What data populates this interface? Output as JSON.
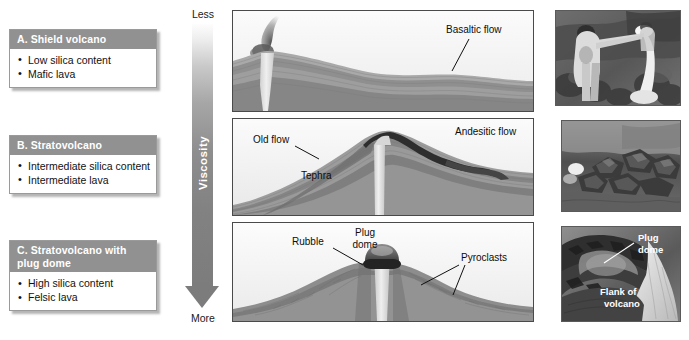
{
  "figure": {
    "viscosity_axis": {
      "title": "Viscosity",
      "top_label": "Less",
      "bottom_label": "More",
      "gradient_light": "#fdfdfd",
      "gradient_dark": "#7c7c7c"
    },
    "types": [
      {
        "header": "A. Shield volcano",
        "bullets": [
          "Low silica content",
          "Mafic lava"
        ],
        "illustration_labels": [
          "Basaltic flow"
        ],
        "photo_caption_labels": []
      },
      {
        "header": "B. Stratovolcano",
        "bullets": [
          "Intermediate silica content",
          "Intermediate lava"
        ],
        "illustration_labels": [
          "Old flow",
          "Tephra",
          "Andesitic flow"
        ],
        "photo_caption_labels": []
      },
      {
        "header": "C. Stratovolcano with plug dome",
        "header_line1": "C. Stratovolcano with",
        "header_line2": "plug dome",
        "bullets": [
          "High silica content",
          "Felsic lava"
        ],
        "illustration_labels": [
          "Rubble",
          "Plug dome",
          "Pyroclasts"
        ],
        "photo_caption_labels": [
          "Plug dome",
          "Flank of volcano"
        ]
      }
    ],
    "panel_a": {
      "label_basaltic_flow": "Basaltic flow"
    },
    "panel_b": {
      "label_old_flow": "Old flow",
      "label_tephra": "Tephra",
      "label_andesitic_flow": "Andesitic flow"
    },
    "panel_c": {
      "label_rubble": "Rubble",
      "label_plug_dome_line1": "Plug",
      "label_plug_dome_line2": "dome",
      "label_pyroclasts": "Pyroclasts"
    },
    "photo_c": {
      "label_plug_line1": "Plug",
      "label_plug_line2": "dome",
      "label_flank_line1": "Flank of",
      "label_flank_line2": "volcano"
    },
    "header_color": "#919191",
    "header_text_color": "#ffffff"
  }
}
